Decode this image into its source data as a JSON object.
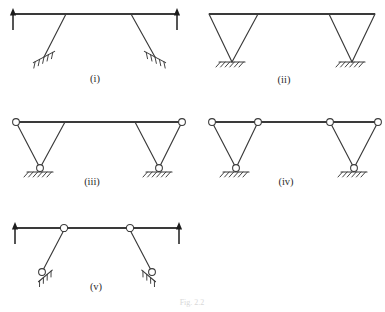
{
  "figure": {
    "caption": "Fig. 2.2",
    "background_color": "#ffffff",
    "line_color": "#3a3a3a",
    "arrow_color": "#1c1c1c",
    "hinge_fill": "#ffffff"
  },
  "cases": [
    {
      "id": "case-i",
      "label": "(i)",
      "label_x": 95,
      "label_y": 82,
      "beam": {
        "x1": 12,
        "y1": 14,
        "x2": 178,
        "y2": 14
      },
      "legs": [
        {
          "x1": 66,
          "y1": 14,
          "x2": 44,
          "y2": 57
        },
        {
          "x1": 131,
          "y1": 14,
          "x2": 155,
          "y2": 57
        }
      ],
      "supports": [
        {
          "type": "inclined-hatch",
          "x": 44,
          "y": 57,
          "mirror": false
        },
        {
          "type": "inclined-hatch",
          "x": 155,
          "y": 57,
          "mirror": true
        }
      ],
      "hinges": [],
      "loads": [
        {
          "x": 13,
          "y_tail": 30,
          "y_head": 8,
          "direction": "up"
        },
        {
          "x": 177,
          "y_tail": 30,
          "y_head": 8,
          "direction": "up"
        }
      ]
    },
    {
      "id": "case-ii",
      "label": "(ii)",
      "label_x": 284,
      "label_y": 83,
      "beam": {
        "x1": 209,
        "y1": 14,
        "x2": 375,
        "y2": 14
      },
      "legs": [
        {
          "x1": 209,
          "y1": 14,
          "x2": 232,
          "y2": 62
        },
        {
          "x1": 258,
          "y1": 14,
          "x2": 232,
          "y2": 62
        },
        {
          "x1": 329,
          "y1": 14,
          "x2": 352,
          "y2": 62
        },
        {
          "x1": 375,
          "y1": 14,
          "x2": 352,
          "y2": 62
        }
      ],
      "supports": [
        {
          "type": "horizontal-hatch",
          "x": 232,
          "y": 62
        },
        {
          "type": "horizontal-hatch",
          "x": 352,
          "y": 62
        }
      ],
      "hinges": [],
      "loads": []
    },
    {
      "id": "case-iii",
      "label": "(iii)",
      "label_x": 92,
      "label_y": 185,
      "beam": {
        "x1": 16,
        "y1": 122,
        "x2": 182,
        "y2": 122
      },
      "legs": [
        {
          "x1": 16,
          "y1": 122,
          "x2": 40,
          "y2": 168
        },
        {
          "x1": 65,
          "y1": 122,
          "x2": 40,
          "y2": 168
        },
        {
          "x1": 135,
          "y1": 122,
          "x2": 159,
          "y2": 168
        },
        {
          "x1": 182,
          "y1": 122,
          "x2": 159,
          "y2": 168
        }
      ],
      "supports": [
        {
          "type": "horizontal-hatch",
          "x": 40,
          "y": 172
        },
        {
          "type": "horizontal-hatch",
          "x": 159,
          "y": 172
        }
      ],
      "hinges": [
        {
          "x": 16,
          "y": 122,
          "r": 3.4
        },
        {
          "x": 182,
          "y": 122,
          "r": 3.4
        },
        {
          "x": 40,
          "y": 168,
          "r": 3.4
        },
        {
          "x": 159,
          "y": 168,
          "r": 3.4
        }
      ],
      "loads": []
    },
    {
      "id": "case-iv",
      "label": "(iv)",
      "label_x": 286,
      "label_y": 185,
      "beam": {
        "x1": 212,
        "y1": 122,
        "x2": 378,
        "y2": 122
      },
      "legs": [
        {
          "x1": 212,
          "y1": 122,
          "x2": 236,
          "y2": 168
        },
        {
          "x1": 258,
          "y1": 122,
          "x2": 236,
          "y2": 168
        },
        {
          "x1": 330,
          "y1": 122,
          "x2": 354,
          "y2": 168
        },
        {
          "x1": 378,
          "y1": 122,
          "x2": 354,
          "y2": 168
        }
      ],
      "supports": [
        {
          "type": "horizontal-hatch",
          "x": 236,
          "y": 172
        },
        {
          "type": "horizontal-hatch",
          "x": 354,
          "y": 172
        }
      ],
      "hinges": [
        {
          "x": 212,
          "y": 122,
          "r": 3.4
        },
        {
          "x": 258,
          "y": 122,
          "r": 3.4
        },
        {
          "x": 330,
          "y": 122,
          "r": 3.4
        },
        {
          "x": 378,
          "y": 122,
          "r": 3.4
        },
        {
          "x": 236,
          "y": 168,
          "r": 3.4
        },
        {
          "x": 354,
          "y": 168,
          "r": 3.4
        }
      ],
      "loads": []
    },
    {
      "id": "case-v",
      "label": "(v)",
      "label_x": 96,
      "label_y": 290,
      "beam": {
        "x1": 14,
        "y1": 228,
        "x2": 180,
        "y2": 228
      },
      "legs": [
        {
          "x1": 64,
          "y1": 230,
          "x2": 42,
          "y2": 272
        },
        {
          "x1": 130,
          "y1": 230,
          "x2": 152,
          "y2": 272
        }
      ],
      "supports": [
        {
          "type": "inclined-pin-hatch",
          "x": 42,
          "y": 272,
          "mirror": false
        },
        {
          "type": "inclined-pin-hatch",
          "x": 152,
          "y": 272,
          "mirror": true
        }
      ],
      "hinges": [
        {
          "x": 64,
          "y": 228,
          "r": 3.6
        },
        {
          "x": 130,
          "y": 228,
          "r": 3.6
        },
        {
          "x": 42,
          "y": 272,
          "r": 3.4
        },
        {
          "x": 152,
          "y": 272,
          "r": 3.4
        }
      ],
      "loads": [
        {
          "x": 15,
          "y_tail": 244,
          "y_head": 222,
          "direction": "up"
        },
        {
          "x": 179,
          "y_tail": 244,
          "y_head": 222,
          "direction": "up"
        }
      ]
    }
  ]
}
